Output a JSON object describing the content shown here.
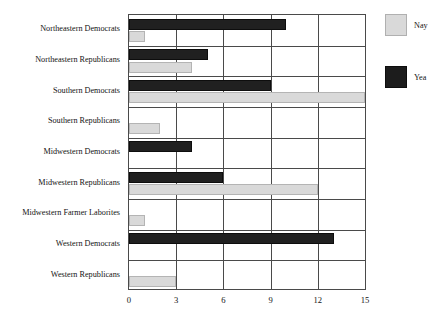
{
  "chart_data": {
    "type": "bar",
    "orientation": "horizontal",
    "title": "",
    "xlabel": "",
    "ylabel": "",
    "xlim": [
      0,
      15
    ],
    "xticks": [
      0,
      3,
      6,
      9,
      12,
      15
    ],
    "xtick_labels": [
      "0",
      "3",
      "6",
      "9",
      "12",
      "15"
    ],
    "grid": true,
    "legend_position": "right",
    "categories": [
      "Northeastern Democrats",
      "Northeastern Republicans",
      "Southern Democrats",
      "Southern Republicans",
      "Midwestern Democrats",
      "Midwestern Republicans",
      "Midwestern Farmer Laborites",
      "Western Democrats",
      "Western Republicans"
    ],
    "series": [
      {
        "name": "Yea",
        "color": "#202020",
        "values": [
          10,
          5,
          9,
          0,
          4,
          6,
          0,
          13,
          0
        ]
      },
      {
        "name": "Nay",
        "color": "#d9d9d9",
        "values": [
          1,
          4,
          15,
          2,
          0,
          12,
          1,
          0,
          3
        ]
      }
    ]
  },
  "legend": {
    "items": [
      {
        "label": "Nay",
        "swatch": "nay-sw"
      },
      {
        "label": "Yea",
        "swatch": "yea-sw"
      }
    ]
  }
}
